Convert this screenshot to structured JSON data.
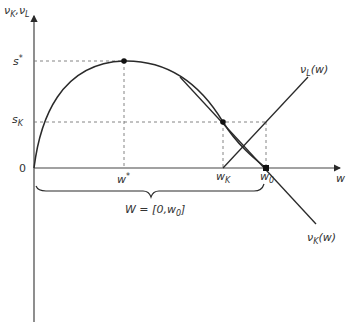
{
  "diagram": {
    "type": "economics-curve-diagram",
    "colors": {
      "line": "#2a2a2a",
      "dashed": "#777777",
      "text": "#333333",
      "background": "#ffffff"
    },
    "y_axis": {
      "label_main": "ν",
      "label_sub_1": "K",
      "label_sep": ",ν",
      "label_sub_2": "L"
    },
    "x_axis": {
      "label": "w"
    },
    "y_ticks": {
      "s_star": {
        "main": "s",
        "sup": "*"
      },
      "s_k": {
        "main": "s",
        "sub": "K"
      },
      "zero": "0"
    },
    "x_ticks": {
      "w_star": {
        "main": "w",
        "sup": "*"
      },
      "w_k": {
        "main": "w",
        "sub": "K"
      },
      "w_0": {
        "main": "w",
        "sub": "0"
      }
    },
    "curves": {
      "nu_l": {
        "main": "ν",
        "sub": "L",
        "arg": "(w)"
      },
      "nu_k": {
        "main": "ν",
        "sub": "K",
        "arg": "(w)"
      }
    },
    "brace_label": {
      "pre": "W = [0,",
      "w": "w",
      "sub": "0",
      "post": "]"
    },
    "points": [
      {
        "name": "peak",
        "x_label": "w*",
        "y_label": "s*"
      },
      {
        "name": "s_k_point",
        "x_label": "w_K",
        "y_label": "s_K"
      },
      {
        "name": "w0_point",
        "x_label": "w_0",
        "y_label": "0"
      }
    ]
  }
}
